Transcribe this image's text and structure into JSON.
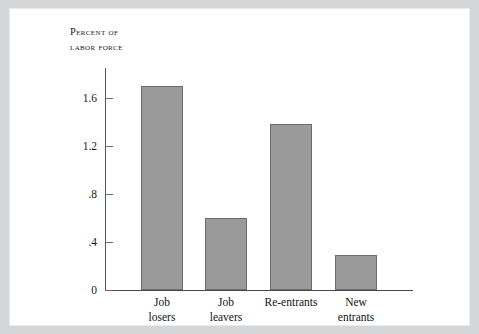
{
  "figure": {
    "frame_color": "#d4d6d8",
    "background": "#ffffff"
  },
  "axis_title": "Percent of\nlabor force",
  "chart_data": {
    "type": "bar",
    "title": "",
    "subtitle": "",
    "xlabel": "",
    "ylabel": "Percent of labor force",
    "categories": [
      "Job losers",
      "Job leavers",
      "Re-entrants",
      "New entrants"
    ],
    "category_lines": [
      "Job\nlosers",
      "Job\nleavers",
      "Re-entrants",
      "New\nentrants"
    ],
    "values": [
      1.7,
      0.6,
      1.38,
      0.29
    ],
    "ylim": [
      0,
      1.85
    ],
    "yticks": [
      0,
      0.4,
      0.8,
      1.2,
      1.6
    ],
    "ytick_labels": [
      "0",
      ".4",
      ".8",
      "1.2",
      "1.6"
    ],
    "grid": false,
    "legend": false,
    "bar_color": "#9a9a9a",
    "bar_edge_color": "#6d6d6d"
  }
}
